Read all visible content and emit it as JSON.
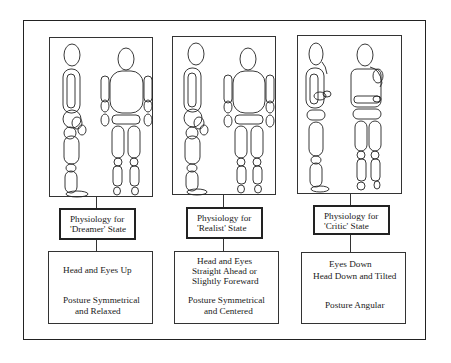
{
  "diagram": {
    "panels": [
      {
        "id": "dreamer",
        "label": {
          "line1": "Physiology for",
          "line2": "'Dreamer' State"
        },
        "description": {
          "lines": [
            "Head and Eyes Up",
            "Posture Symmetrical",
            "and Relaxed"
          ]
        },
        "figures": [
          "side-view-figure-upright",
          "front-view-figure-relaxed"
        ]
      },
      {
        "id": "realist",
        "label": {
          "line1": "Physiology for",
          "line2": "'Realist' State"
        },
        "description": {
          "lines": [
            "Head and Eyes",
            "Straight Ahead or",
            "Slightly Foreward",
            "Posture Symmetrical",
            "and Centered"
          ]
        },
        "figures": [
          "side-view-figure-straight",
          "front-view-figure-centered"
        ]
      },
      {
        "id": "critic",
        "label": {
          "line1": "Physiology for",
          "line2": "'Critic' State"
        },
        "description": {
          "lines": [
            "Eyes Down",
            "Head Down and Tilted",
            "Posture Angular"
          ]
        },
        "figures": [
          "side-view-figure-hand-to-chin",
          "front-view-figure-hand-to-chin"
        ]
      }
    ]
  },
  "colors": {
    "line": "#222222",
    "background": "#ffffff"
  }
}
